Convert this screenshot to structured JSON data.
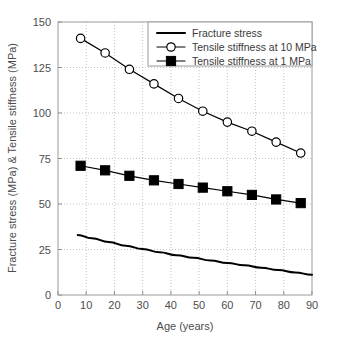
{
  "chart_data": {
    "type": "line",
    "title": "",
    "xlabel": "Age (years)",
    "ylabel": "Fracture stress (MPa) & Tensile stiffness (MPa)",
    "xlim": [
      0,
      90
    ],
    "ylim": [
      0,
      150
    ],
    "xticks": [
      0,
      10,
      20,
      30,
      40,
      50,
      60,
      70,
      80,
      90
    ],
    "yticks": [
      0,
      25,
      50,
      75,
      100,
      125,
      150
    ],
    "xtick_labels": [
      "0",
      "10",
      "20",
      "30",
      "40",
      "50",
      "60",
      "70",
      "80",
      "90"
    ],
    "ytick_labels": [
      "0",
      "25",
      "50",
      "75",
      "100",
      "125",
      "150"
    ],
    "grid": true,
    "grid_style": "dotted",
    "legend_position": "top-right",
    "series": [
      {
        "name": "Fracture stress",
        "marker": "none",
        "line": "solid",
        "color": "#000000",
        "x": [
          7,
          12,
          18,
          24,
          30,
          36,
          42,
          48,
          54,
          60,
          66,
          72,
          78,
          84,
          90
        ],
        "values": [
          33.0,
          31.2,
          29.1,
          27.1,
          25.3,
          23.5,
          21.9,
          20.4,
          19.0,
          17.6,
          16.3,
          15.0,
          13.7,
          12.4,
          11.1
        ]
      },
      {
        "name": "Tensile stiffness at 10 MPa",
        "marker": "open-circle",
        "line": "solid",
        "color": "#000000",
        "x": [
          8,
          16.7,
          25.3,
          34,
          42.7,
          51.3,
          60,
          68.7,
          77.3,
          86
        ],
        "values": [
          141,
          133,
          124,
          116,
          108,
          101,
          95,
          90,
          84,
          78
        ]
      },
      {
        "name": "Tensile stiffness at 1 MPa",
        "marker": "filled-square",
        "line": "solid",
        "color": "#000000",
        "x": [
          8,
          16.7,
          25.3,
          34,
          42.7,
          51.3,
          60,
          68.7,
          77.3,
          86
        ],
        "values": [
          71,
          68.5,
          65.5,
          63,
          61,
          59,
          57,
          55,
          52.5,
          50.5
        ]
      }
    ]
  },
  "legend": {
    "items": [
      {
        "label": "Fracture stress",
        "marker": "none"
      },
      {
        "label": "Tensile stiffness at 10 MPa",
        "marker": "open-circle"
      },
      {
        "label": "Tensile stiffness at 1 MPa",
        "marker": "filled-square"
      }
    ]
  }
}
